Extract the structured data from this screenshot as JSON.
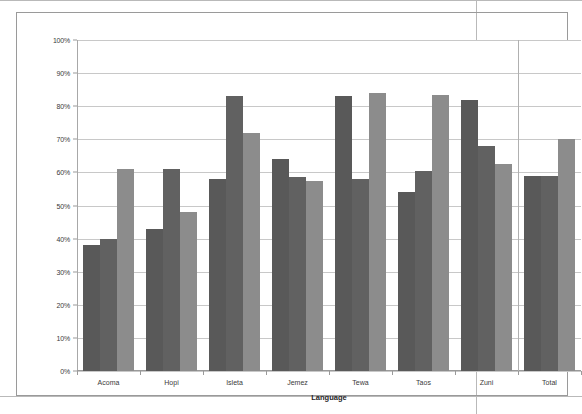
{
  "chart_data": {
    "type": "bar",
    "title": "",
    "xlabel": "Language",
    "ylabel": "",
    "categories": [
      "Acoma",
      "Hopi",
      "Isleta",
      "Jemez",
      "Tewa",
      "Taos",
      "Zuni",
      "Total"
    ],
    "series": [
      {
        "name": "16th",
        "color": "#595959",
        "values": [
          38,
          43,
          58,
          64,
          83,
          54,
          82,
          59
        ]
      },
      {
        "name": "17th",
        "color": "#616161",
        "values": [
          40,
          61,
          83,
          58.5,
          58,
          60.5,
          68,
          59
        ]
      },
      {
        "name": "18th+",
        "color": "#8c8c8c",
        "values": [
          61,
          48,
          72,
          57.5,
          84,
          83.5,
          62.5,
          70
        ]
      }
    ],
    "ylim": [
      0,
      100
    ],
    "ytick_labels": [
      "0%",
      "10%",
      "20%",
      "30%",
      "40%",
      "50%",
      "60%",
      "70%",
      "80%",
      "90%",
      "100%"
    ],
    "ytick_values": [
      0,
      10,
      20,
      30,
      40,
      50,
      60,
      70,
      80,
      90,
      100
    ],
    "grid": true,
    "legend_position": "inside-upper-left",
    "value_suffix": "%",
    "separator_before_category": "Total"
  }
}
